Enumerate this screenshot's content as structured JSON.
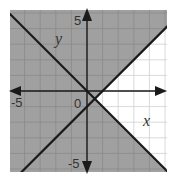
{
  "chart_data": {
    "type": "line",
    "title": "",
    "xlabel": "x",
    "ylabel": "y",
    "xlim": [
      -5,
      5
    ],
    "ylim": [
      -5,
      5
    ],
    "grid": true,
    "tick_labels": {
      "x": [
        "-5"
      ],
      "y": [
        "5",
        "-5"
      ],
      "origin": "0"
    },
    "series": [
      {
        "name": "line 1",
        "equation": "y = x - 1",
        "slope": 1,
        "intercept": -1,
        "points": [
          [
            -4,
            -5
          ],
          [
            5,
            4
          ]
        ]
      },
      {
        "name": "line 2",
        "equation": "y = -x",
        "slope": -1,
        "intercept": 0,
        "points": [
          [
            -5,
            5
          ],
          [
            5,
            -5
          ]
        ]
      }
    ],
    "shading": {
      "description": "Shaded region: y >= x - 1 OR y <= -x; unshaded wedge to the right of intersection (0.5, -0.5)",
      "shaded_color": "#a0a0a0",
      "unshaded_color": "#ffffff"
    },
    "intersection": [
      0.5,
      -0.5
    ]
  },
  "labels": {
    "x_axis": "x",
    "y_axis": "y",
    "x_min": "-5",
    "y_max": "5",
    "y_min": "-5",
    "origin": "0"
  },
  "colors": {
    "shade": "#a0a0a0",
    "grid_on_shade": "#8e8e8e",
    "grid_on_white": "#d0d0d0",
    "line": "#1a1a1a",
    "axis": "#1a1a1a"
  }
}
